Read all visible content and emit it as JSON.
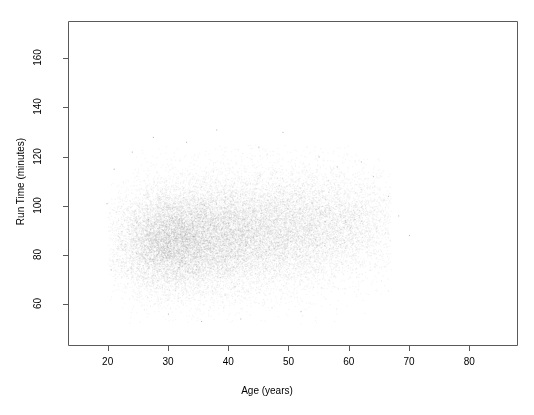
{
  "figure": {
    "width": 534,
    "height": 415,
    "background": "#ffffff",
    "axis_color": "#5a5a5a",
    "text_color": "#000000",
    "point_color": "#808080"
  },
  "chart_data": {
    "type": "scatter",
    "title": "",
    "xlabel": "Age (years)",
    "ylabel": "Run Time (minutes)",
    "xlim": [
      13.5,
      88
    ],
    "ylim": [
      43,
      175
    ],
    "xticks": [
      20,
      30,
      40,
      50,
      60,
      70,
      80
    ],
    "xtick_labels": [
      "20",
      "30",
      "40",
      "50",
      "60",
      "70",
      "80"
    ],
    "yticks": [
      60,
      80,
      100,
      120,
      140,
      160
    ],
    "ytick_labels": [
      "60",
      "80",
      "100",
      "120",
      "140",
      "160"
    ],
    "grid": false,
    "legend": null,
    "box": true,
    "n_points": 26000,
    "point_size": 1,
    "point_alpha": 0.08,
    "distribution": {
      "x_mean": 38.5,
      "x_sd": 9.0,
      "x_min": 20.0,
      "x_max": 67.0,
      "y_mean": 87.0,
      "y_sd": 12.5,
      "y_min": 52.0,
      "y_max": 125.0,
      "correlation": 0.06
    },
    "density_clusters": [
      {
        "x": 29.0,
        "y": 85.0,
        "x_sd": 4.2,
        "y_sd": 10.5,
        "weight": 0.28
      },
      {
        "x": 36.0,
        "y": 87.0,
        "x_sd": 5.0,
        "y_sd": 11.5,
        "weight": 0.26
      },
      {
        "x": 43.5,
        "y": 88.5,
        "x_sd": 5.2,
        "y_sd": 11.8,
        "weight": 0.2
      },
      {
        "x": 51.0,
        "y": 90.0,
        "x_sd": 5.0,
        "y_sd": 11.5,
        "weight": 0.14
      },
      {
        "x": 57.5,
        "y": 91.5,
        "x_sd": 4.5,
        "y_sd": 11.0,
        "weight": 0.08
      },
      {
        "x": 62.5,
        "y": 92.5,
        "x_sd": 4.0,
        "y_sd": 10.0,
        "weight": 0.04
      }
    ]
  }
}
